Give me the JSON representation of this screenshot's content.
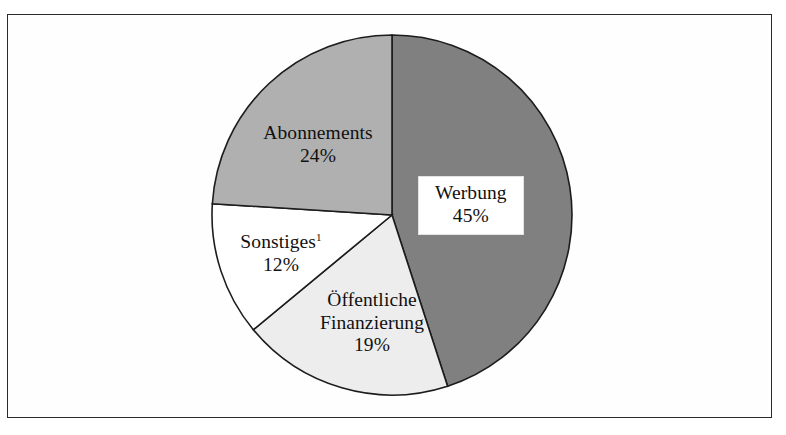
{
  "chart_data": {
    "type": "pie",
    "title": "",
    "subtitle": "",
    "xlabel": "",
    "ylabel": "",
    "start_angle_deg": 0,
    "direction": "clockwise",
    "legend": "none",
    "grid": false,
    "categories": [
      "Werbung",
      "Öffentliche Finanzierung",
      "Sonstiges",
      "Abonnements"
    ],
    "values": [
      45,
      19,
      12,
      24
    ],
    "value_unit": "%",
    "slices": [
      {
        "label": "Werbung",
        "label_lines": [
          "Werbung"
        ],
        "value": 45,
        "value_text": "45%",
        "color": "#808080",
        "start_deg": 0,
        "end_deg": 162,
        "label_boxed": true,
        "footnote_marker": ""
      },
      {
        "label": "Öffentliche Finanzierung",
        "label_lines": [
          "Öffentliche",
          "Finanzierung"
        ],
        "value": 19,
        "value_text": "19%",
        "color": "#ededed",
        "start_deg": 162,
        "end_deg": 230.4,
        "label_boxed": false,
        "footnote_marker": ""
      },
      {
        "label": "Sonstiges",
        "label_lines": [
          "Sonstiges"
        ],
        "value": 12,
        "value_text": "12%",
        "color": "#ffffff",
        "start_deg": 230.4,
        "end_deg": 273.6,
        "label_boxed": false,
        "footnote_marker": "1"
      },
      {
        "label": "Abonnements",
        "label_lines": [
          "Abonnements"
        ],
        "value": 24,
        "value_text": "24%",
        "color": "#b0b0b0",
        "start_deg": 273.6,
        "end_deg": 360,
        "label_boxed": false,
        "footnote_marker": ""
      }
    ],
    "colors": {
      "werbung": "#808080",
      "oeffentliche_finanzierung": "#ededed",
      "sonstiges": "#ffffff",
      "abonnements": "#b0b0b0",
      "outline": "#1c1c1c",
      "frame": "#2b2b2b",
      "background": "#ffffff"
    }
  },
  "labels": {
    "werbung": {
      "name": "Werbung",
      "percent": "45%"
    },
    "abonnements": {
      "name": "Abonnements",
      "percent": "24%"
    },
    "sonstiges": {
      "name": "Sonstiges",
      "marker": "1",
      "percent": "12%"
    },
    "oeffentliche": {
      "name_line1": "Öffentliche",
      "name_line2": "Finanzierung",
      "percent": "19%"
    }
  }
}
